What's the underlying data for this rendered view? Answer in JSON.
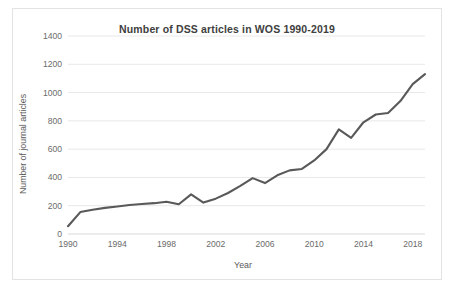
{
  "chart_data": {
    "type": "line",
    "title": "Number of DSS articles in WOS 1990-2019",
    "xlabel": "Year",
    "ylabel": "Number of journal articles",
    "x": [
      1990,
      1991,
      1992,
      1993,
      1994,
      1995,
      1996,
      1997,
      1998,
      1999,
      2000,
      2001,
      2002,
      2003,
      2004,
      2005,
      2006,
      2007,
      2008,
      2009,
      2010,
      2011,
      2012,
      2013,
      2014,
      2015,
      2016,
      2017,
      2018,
      2019
    ],
    "values": [
      55,
      155,
      172,
      185,
      195,
      205,
      212,
      218,
      228,
      210,
      280,
      222,
      250,
      290,
      340,
      395,
      360,
      415,
      450,
      460,
      520,
      600,
      740,
      680,
      790,
      845,
      855,
      940,
      1060,
      1130
    ],
    "series": [
      {
        "name": "Number of journal articles",
        "values": [
          55,
          155,
          172,
          185,
          195,
          205,
          212,
          218,
          228,
          210,
          280,
          222,
          250,
          290,
          340,
          395,
          360,
          415,
          450,
          460,
          520,
          600,
          740,
          680,
          790,
          845,
          855,
          940,
          1060,
          1130
        ]
      }
    ],
    "xlim": [
      1990,
      2019
    ],
    "ylim": [
      0,
      1400
    ],
    "ytick_labels": [
      "0",
      "200",
      "400",
      "600",
      "800",
      "1000",
      "1200",
      "1400"
    ],
    "ytick_values": [
      0,
      200,
      400,
      600,
      800,
      1000,
      1200,
      1400
    ],
    "xtick_labels": [
      "1990",
      "1994",
      "1998",
      "2002",
      "2006",
      "2010",
      "2014",
      "2018"
    ],
    "xtick_values": [
      1990,
      1994,
      1998,
      2002,
      2006,
      2010,
      2014,
      2018
    ],
    "grid": "horizontal",
    "legend": "none",
    "line_color": "#595959",
    "grid_color": "#e8e8e8",
    "background_color": "#ffffff",
    "border_color": "#e3e3e3"
  }
}
